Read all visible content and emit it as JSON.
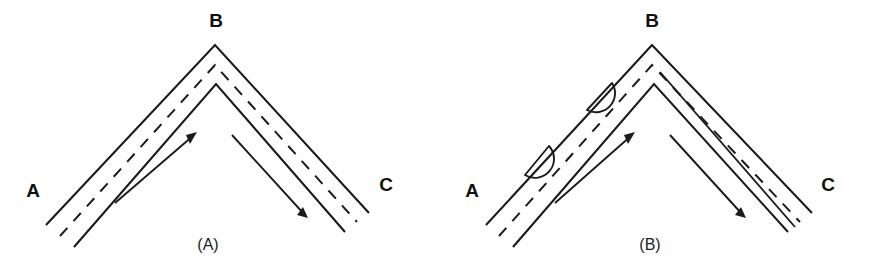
{
  "figure": {
    "background_color": "#ffffff",
    "ink_color": "#1b1b1b",
    "width": 878,
    "height": 274
  },
  "panels": [
    {
      "id": "panel-a",
      "caption": "(A)",
      "caption_x": 208,
      "caption_y": 246,
      "node_labels": [
        {
          "name": "node-a",
          "text": "A",
          "x": 33,
          "y": 192
        },
        {
          "name": "node-b",
          "text": "B",
          "x": 216,
          "y": 22
        },
        {
          "name": "node-c",
          "text": "C",
          "x": 386,
          "y": 186
        }
      ],
      "outer_edge": "M 46,225 L 215,45 L 369,213",
      "inner_edge": "M 74,247 L 216,84 L 345,232",
      "center_dash": "M 60,236 L 215,65 L 357,222",
      "lane_dividers": [],
      "bulges": [],
      "arrows": [
        {
          "name": "flow-arrow-up-ab",
          "direction": "up-right",
          "shaft": "M 115,203 L 194,135",
          "head": "M 197,132 L 186,135 L 190,144 Z"
        },
        {
          "name": "flow-arrow-down-bc",
          "direction": "down-right",
          "shaft": "M 232,135 L 304,214",
          "head": "M 308,218 L 297,215 L 303,207 Z"
        }
      ]
    },
    {
      "id": "panel-b",
      "caption": "(B)",
      "caption_x": 650,
      "caption_y": 246,
      "node_labels": [
        {
          "name": "node-a",
          "text": "A",
          "x": 472,
          "y": 192
        },
        {
          "name": "node-b",
          "text": "B",
          "x": 652,
          "y": 22
        },
        {
          "name": "node-c",
          "text": "C",
          "x": 828,
          "y": 186
        }
      ],
      "outer_edge": "M 486,225 L 652,45 L 812,213",
      "inner_edge": "M 513,247 L 654,84 L 788,232",
      "center_dash": "M 499,236 L 652,65 L 800,222",
      "lane_dividers": [
        "M 660,72 L 795,227"
      ],
      "bulges": [
        {
          "name": "widening-bulge-lower",
          "start": [
            525,
            175
          ],
          "end": [
            549,
            146
          ],
          "radius": 19
        },
        {
          "name": "widening-bulge-upper",
          "start": [
            587,
            110
          ],
          "end": [
            612,
            83
          ],
          "radius": 19
        }
      ],
      "arrows": [
        {
          "name": "flow-arrow-up-ab",
          "direction": "up-right",
          "shaft": "M 555,203 L 632,135",
          "head": "M 635,132 L 624,135 L 628,144 Z"
        },
        {
          "name": "flow-arrow-down-bc",
          "direction": "down-right",
          "shaft": "M 670,135 L 742,214",
          "head": "M 746,218 L 735,215 L 741,207 Z"
        }
      ]
    }
  ]
}
